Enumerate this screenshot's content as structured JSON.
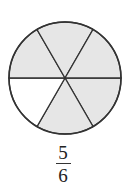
{
  "diagram": {
    "type": "fraction-circle",
    "total_parts": 6,
    "shaded_parts": 5,
    "unshaded_sector_index": 3,
    "shade_color": "#e6e6e6",
    "stroke_color": "#333333",
    "fraction": {
      "numerator": "5",
      "denominator": "6"
    }
  }
}
